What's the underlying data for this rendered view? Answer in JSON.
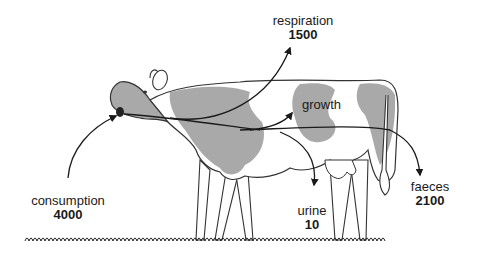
{
  "diagram": {
    "colors": {
      "patch": "#a9a9a9",
      "outline": "#333333",
      "arrow": "#1a1a1a",
      "background": "#ffffff"
    },
    "flows": {
      "consumption": {
        "label": "consumption",
        "value": "4000",
        "direction": "in"
      },
      "respiration": {
        "label": "respiration",
        "value": "1500",
        "direction": "out"
      },
      "growth": {
        "label": "growth",
        "direction": "retained"
      },
      "urine": {
        "label": "urine",
        "value": "10",
        "direction": "out"
      },
      "faeces": {
        "label": "faeces",
        "value": "2100",
        "direction": "out"
      }
    }
  }
}
